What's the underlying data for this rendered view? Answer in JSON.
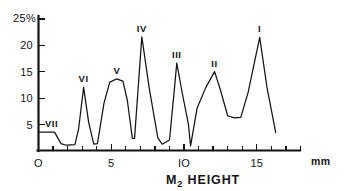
{
  "chart_data": {
    "type": "line",
    "title": "M2 HEIGHT",
    "title_main": "M",
    "title_sub": "2",
    "title_rest": "HEIGHT",
    "xlabel": "mm",
    "ylabel": "25%",
    "y_unit_label": "25%",
    "xlim": [
      0,
      18
    ],
    "ylim": [
      0,
      25
    ],
    "grid": false,
    "legend": "none",
    "x_ticks_major": [
      0,
      5,
      10,
      15
    ],
    "x_tick_labels": [
      "O",
      "5",
      "IO",
      "15"
    ],
    "x_ticks_minor_step": 1,
    "x_tick_count": 19,
    "y_ticks": [
      5,
      10,
      15,
      20,
      25
    ],
    "y_tick_labels": [
      "5",
      "10",
      "15",
      "20",
      "25%"
    ],
    "annotations": [
      {
        "label": "VII",
        "x": 0.9,
        "y": 3.5
      },
      {
        "label": "VI",
        "x": 3.1,
        "y": 12.0
      },
      {
        "label": "V",
        "x": 5.4,
        "y": 13.6
      },
      {
        "label": "IV",
        "x": 7.1,
        "y": 21.6
      },
      {
        "label": "III",
        "x": 9.5,
        "y": 16.6
      },
      {
        "label": "II",
        "x": 12.1,
        "y": 15.0
      },
      {
        "label": "I",
        "x": 15.2,
        "y": 21.5
      }
    ],
    "x": [
      0.0,
      1.1,
      1.55,
      1.9,
      2.5,
      2.75,
      3.1,
      3.45,
      3.8,
      4.05,
      4.5,
      4.9,
      5.35,
      5.8,
      6.1,
      6.45,
      6.6,
      7.1,
      7.6,
      8.2,
      8.5,
      9.0,
      9.35,
      9.5,
      9.9,
      10.3,
      10.45,
      10.9,
      11.5,
      12.1,
      12.5,
      13.0,
      13.45,
      13.9,
      14.4,
      15.2,
      15.7,
      16.3
    ],
    "y": [
      3.5,
      3.5,
      1.3,
      1.0,
      1.1,
      4.0,
      12.0,
      5.3,
      1.2,
      1.3,
      9.0,
      13.0,
      13.6,
      13.2,
      9.6,
      2.3,
      2.3,
      21.6,
      12.0,
      2.4,
      1.2,
      2.0,
      12.0,
      16.6,
      10.6,
      5.0,
      0.9,
      8.1,
      12.0,
      15.0,
      11.5,
      6.6,
      6.2,
      6.3,
      11.0,
      21.5,
      12.0,
      3.4
    ],
    "series_name": "M2 height frequency",
    "values_description": "percentage frequency versus M2 height in millimetres"
  }
}
